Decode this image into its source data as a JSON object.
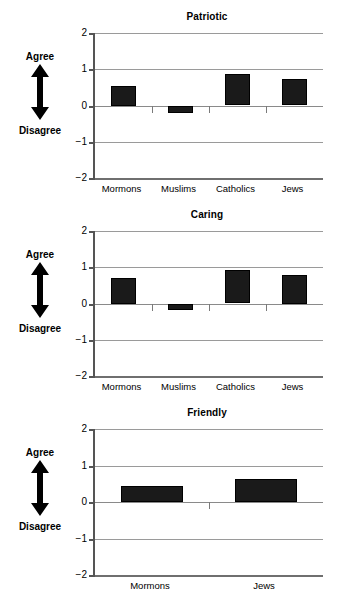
{
  "figure": {
    "axis_annotation": {
      "top_label": "Agree",
      "bottom_label": "Disagree",
      "arrow_icon": "double-headed-vertical-arrow-icon"
    },
    "y_axis": {
      "ticks": [
        "2",
        "1",
        "0",
        "-1",
        "-2"
      ],
      "min": -2,
      "max": 2
    }
  },
  "chart_data": [
    {
      "type": "bar",
      "title": "Patriotic",
      "xlabel": "",
      "ylabel": "Agree / Disagree",
      "ylim": [
        -2,
        2
      ],
      "yticks": [
        2,
        1,
        0,
        -1,
        -2
      ],
      "grid": true,
      "legend": "none",
      "categories": [
        "Mormons",
        "Muslims",
        "Catholics",
        "Jews"
      ],
      "values": [
        0.55,
        -0.2,
        0.86,
        0.72
      ]
    },
    {
      "type": "bar",
      "title": "Caring",
      "xlabel": "",
      "ylabel": "Agree / Disagree",
      "ylim": [
        -2,
        2
      ],
      "yticks": [
        2,
        1,
        0,
        -1,
        -2
      ],
      "grid": true,
      "legend": "none",
      "categories": [
        "Mormons",
        "Muslims",
        "Catholics",
        "Jews"
      ],
      "values": [
        0.7,
        -0.17,
        0.92,
        0.8
      ]
    },
    {
      "type": "bar",
      "title": "Friendly",
      "xlabel": "",
      "ylabel": "Agree / Disagree",
      "ylim": [
        -2,
        2
      ],
      "yticks": [
        2,
        1,
        0,
        -1,
        -2
      ],
      "grid": true,
      "legend": "none",
      "categories": [
        "Mormons",
        "Jews"
      ],
      "values": [
        0.45,
        0.63
      ]
    }
  ],
  "colors": {
    "bar": "#1a1a1a",
    "grid": "#9a9a9a",
    "axis": "#555555",
    "text": "#000000",
    "background": "#ffffff"
  }
}
